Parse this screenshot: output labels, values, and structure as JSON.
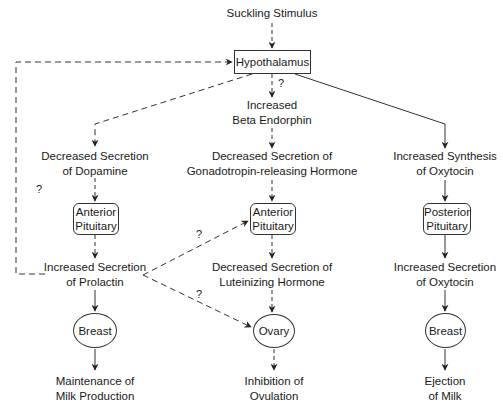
{
  "diagram": {
    "nodes": {
      "stimulus": "Suckling Stimulus",
      "hypothalamus": "Hypothalamus",
      "beta_endorphin": [
        "Increased",
        "Beta Endorphin"
      ],
      "dopamine": [
        "Decreased Secretion",
        "of Dopamine"
      ],
      "gnrh": [
        "Decreased Secretion of",
        "Gonadotropin-releasing Hormone"
      ],
      "oxytocin_synthesis": [
        "Increased Synthesis",
        "of Oxytocin"
      ],
      "anterior_pituitary_left": [
        "Anterior",
        "Pituitary"
      ],
      "anterior_pituitary_mid": [
        "Anterior",
        "Pituitary"
      ],
      "posterior_pituitary": [
        "Posterior",
        "Pituitary"
      ],
      "prolactin": [
        "Increased Secretion",
        "of Prolactin"
      ],
      "lh": [
        "Decreased Secretion of",
        "Luteinizing Hormone"
      ],
      "oxytocin_secretion": [
        "Increased Secretion",
        "of Oxytocin"
      ],
      "breast_left": "Breast",
      "ovary": "Ovary",
      "breast_right": "Breast",
      "milk_production": [
        "Maintenance of",
        "Milk Production"
      ],
      "ovulation": [
        "Inhibition of",
        "Ovulation"
      ],
      "milk_ejection": [
        "Ejection",
        "of Milk"
      ]
    },
    "question_marks": {
      "hypothalamus_to_endorphin": "?",
      "feedback_loop": "?",
      "prolactin_to_pituitary": "?",
      "prolactin_to_ovary": "?"
    },
    "edges": [
      {
        "from": "stimulus",
        "to": "hypothalamus",
        "style": "dashed"
      },
      {
        "from": "prolactin",
        "to": "hypothalamus",
        "style": "dashed",
        "label": "?"
      },
      {
        "from": "hypothalamus",
        "to": "beta_endorphin",
        "style": "dashed",
        "label": "?"
      },
      {
        "from": "hypothalamus",
        "to": "dopamine",
        "style": "dashed"
      },
      {
        "from": "hypothalamus",
        "to": "oxytocin_synthesis",
        "style": "solid"
      },
      {
        "from": "beta_endorphin",
        "to": "gnrh",
        "style": "dashed"
      },
      {
        "from": "dopamine",
        "to": "anterior_pituitary_left",
        "style": "dashed"
      },
      {
        "from": "anterior_pituitary_left",
        "to": "prolactin",
        "style": "dashed"
      },
      {
        "from": "gnrh",
        "to": "anterior_pituitary_mid",
        "style": "dashed"
      },
      {
        "from": "prolactin",
        "to": "anterior_pituitary_mid",
        "style": "dashed",
        "label": "?"
      },
      {
        "from": "prolactin",
        "to": "ovary",
        "style": "dashed",
        "label": "?"
      },
      {
        "from": "anterior_pituitary_mid",
        "to": "lh",
        "style": "dashed"
      },
      {
        "from": "lh",
        "to": "ovary",
        "style": "dashed"
      },
      {
        "from": "ovary",
        "to": "ovulation",
        "style": "dashed"
      },
      {
        "from": "prolactin",
        "to": "breast_left",
        "style": "solid"
      },
      {
        "from": "breast_left",
        "to": "milk_production",
        "style": "solid"
      },
      {
        "from": "oxytocin_synthesis",
        "to": "posterior_pituitary",
        "style": "solid"
      },
      {
        "from": "posterior_pituitary",
        "to": "oxytocin_secretion",
        "style": "solid"
      },
      {
        "from": "oxytocin_secretion",
        "to": "breast_right",
        "style": "solid"
      },
      {
        "from": "breast_right",
        "to": "milk_ejection",
        "style": "solid"
      }
    ],
    "colors": {
      "line": "#333333",
      "text": "#1a1a1a",
      "background": "#ffffff"
    }
  }
}
